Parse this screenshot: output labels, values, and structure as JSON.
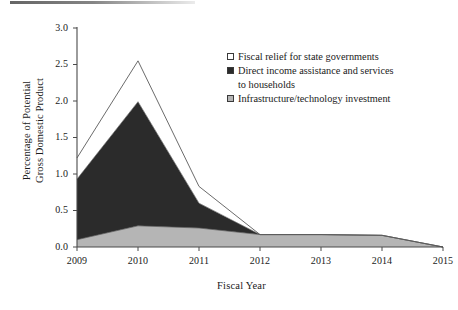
{
  "figure": {
    "name": "stacked-area-chart"
  },
  "chart_data": {
    "type": "area",
    "title": "",
    "subtitle": "",
    "xlabel": "Fiscal Year",
    "ylabel": "Percentage of Potential\nGross Domestic Product",
    "stacked": true,
    "grid": false,
    "legend_position": "inside-top-right",
    "x": [
      2009,
      2010,
      2011,
      2012,
      2013,
      2014,
      2015
    ],
    "xtick_labels": [
      "2009",
      "2010",
      "2011",
      "2012",
      "2013",
      "2014",
      "2015"
    ],
    "xlim": [
      2009,
      2015
    ],
    "ylim": [
      0.0,
      3.0
    ],
    "ytick_labels": [
      "0.0",
      "0.5",
      "1.0",
      "1.5",
      "2.0",
      "2.5",
      "3.0"
    ],
    "ytick_values": [
      0.0,
      0.5,
      1.0,
      1.5,
      2.0,
      2.5,
      3.0
    ],
    "series": [
      {
        "name": "Infrastructure/technology investment",
        "color": "#b5b5b5",
        "swatch": "gray",
        "values": [
          0.1,
          0.29,
          0.26,
          0.17,
          0.17,
          0.16,
          0.0
        ]
      },
      {
        "name": "Direct income assistance and services to households",
        "color": "#2b2b2b",
        "swatch": "dark",
        "values": [
          0.83,
          1.7,
          0.34,
          0.0,
          0.0,
          0.0,
          0.0
        ]
      },
      {
        "name": "Fiscal relief for state governments",
        "color": "#ffffff",
        "swatch": "white",
        "values": [
          0.29,
          0.56,
          0.23,
          0.0,
          0.0,
          0.0,
          0.0
        ]
      }
    ],
    "cumulative_totals": {
      "infrastructure": [
        0.1,
        0.29,
        0.26,
        0.17,
        0.17,
        0.16,
        0.0
      ],
      "plus_direct_income": [
        0.93,
        1.99,
        0.6,
        0.17,
        0.17,
        0.16,
        0.0
      ],
      "plus_fiscal_relief": [
        1.22,
        2.55,
        0.83,
        0.17,
        0.17,
        0.16,
        0.0
      ]
    }
  },
  "legend": {
    "items": [
      {
        "label": "Fiscal relief for state governments",
        "continuation": "",
        "swatch": "white"
      },
      {
        "label": "Direct income assistance and services",
        "continuation": "to households",
        "swatch": "dark"
      },
      {
        "label": "Infrastructure/technology investment",
        "continuation": "",
        "swatch": "gray"
      }
    ]
  },
  "colors": {
    "axis": "#4a4a4a",
    "outline": "#5a5a5a",
    "dark_fill": "#2b2b2b",
    "gray_fill": "#b5b5b5",
    "white_fill": "#ffffff",
    "text": "#1a1a1a"
  }
}
